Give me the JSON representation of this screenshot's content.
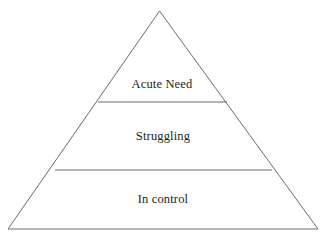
{
  "diagram": {
    "type": "pyramid",
    "orientation": "upward",
    "background_color": "#ffffff",
    "stroke_color": "#6b6b6b",
    "text_color": "#231f20",
    "tier_count": 3,
    "tiers": [
      {
        "id": "tier-top",
        "label": "Acute Need",
        "position": "top",
        "rank": 1
      },
      {
        "id": "tier-middle",
        "label": "Struggling",
        "position": "middle",
        "rank": 2
      },
      {
        "id": "tier-bottom",
        "label": "In control",
        "position": "bottom",
        "rank": 3
      }
    ],
    "geometry": {
      "apex": {
        "x": 159.5,
        "y": 11
      },
      "bottom_left": {
        "x": 8,
        "y": 229
      },
      "bottom_right": {
        "x": 318,
        "y": 229
      },
      "divider_upper": {
        "y": 102,
        "x_start": 98,
        "x_end": 227
      },
      "divider_lower": {
        "y": 170,
        "x_start": 55,
        "x_end": 272
      },
      "label_positions": [
        {
          "x": 162,
          "y": 88
        },
        {
          "x": 163,
          "y": 140
        },
        {
          "x": 163,
          "y": 203
        }
      ]
    }
  }
}
